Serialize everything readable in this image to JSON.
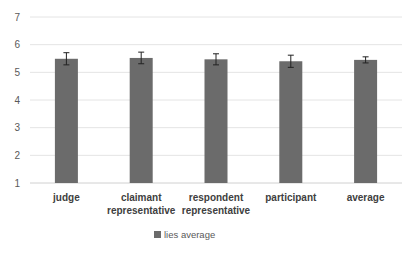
{
  "chart_data": {
    "type": "bar",
    "title": "",
    "xlabel": "",
    "ylabel": "",
    "ylim": [
      1,
      7
    ],
    "yticks": [
      1,
      2,
      3,
      4,
      5,
      6,
      7
    ],
    "grid": true,
    "legend_position": "bottom",
    "categories": [
      "judge",
      "claimant representative",
      "respondent representative",
      "participant",
      "average"
    ],
    "category_lines": [
      [
        "judge"
      ],
      [
        "claimant",
        "representative"
      ],
      [
        "respondent",
        "representative"
      ],
      [
        "participant"
      ],
      [
        "average"
      ]
    ],
    "series": [
      {
        "name": "lies average",
        "color": "#6b6b6b",
        "values": [
          5.49,
          5.52,
          5.47,
          5.4,
          5.45
        ],
        "error": [
          0.22,
          0.21,
          0.2,
          0.22,
          0.11
        ]
      }
    ]
  },
  "legend": {
    "label": "lies average"
  }
}
